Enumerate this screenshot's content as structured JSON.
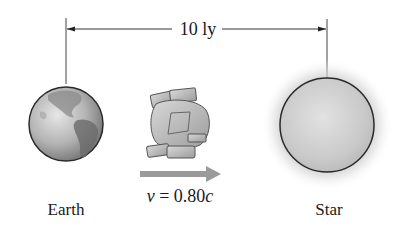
{
  "diagram": {
    "distance_label": "10 ly",
    "earth_label": "Earth",
    "star_label": "Star",
    "velocity": {
      "symbol": "v",
      "equals": " = ",
      "value": "0.80",
      "unit": "c"
    }
  },
  "colors": {
    "line": "#333333",
    "velocity_arrow": "#9a9a9a",
    "earth_outline": "#2a2a2a",
    "star_outline": "#2a2a2a",
    "star_glow": "#cfcfcf"
  }
}
